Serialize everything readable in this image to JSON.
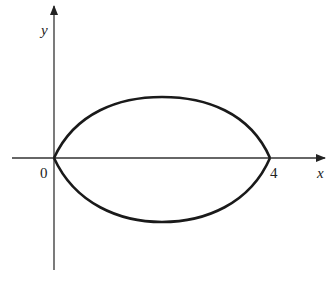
{
  "diagram": {
    "type": "closed curve (lens shape) on coordinate axes",
    "axes": {
      "x_label": "x",
      "y_label": "y",
      "origin_label": "0",
      "x_tick_label": "4"
    },
    "curve": {
      "description": "Symmetric closed curve about the x-axis, meeting the x-axis at x=0 and x=4",
      "endpoints": [
        0,
        4
      ]
    },
    "colors": {
      "stroke": "#1a1a1a",
      "axis": "#333333",
      "background": "#ffffff"
    }
  }
}
